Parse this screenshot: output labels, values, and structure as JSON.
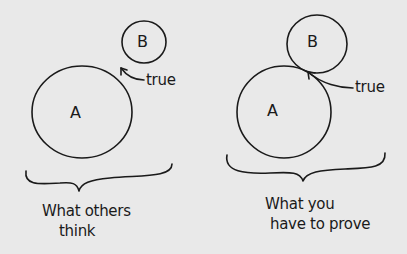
{
  "background_color": "#e9e9e9",
  "ink_color": "#1a1a1a",
  "panels": [
    {
      "id": "left",
      "circles": [
        {
          "label": "A",
          "cx": 82,
          "cy": 112,
          "r": 49
        },
        {
          "label": "B",
          "cx": 144,
          "cy": 42,
          "r": 22
        }
      ],
      "arrow_label": "true",
      "caption_lines": [
        "What others",
        "think"
      ]
    },
    {
      "id": "right",
      "circles": [
        {
          "label": "A",
          "cx": 284,
          "cy": 114,
          "r": 46
        },
        {
          "label": "B",
          "cx": 317,
          "cy": 46,
          "r": 30
        }
      ],
      "arrow_label": "true",
      "caption_lines": [
        "What you",
        "have to prove"
      ]
    }
  ]
}
